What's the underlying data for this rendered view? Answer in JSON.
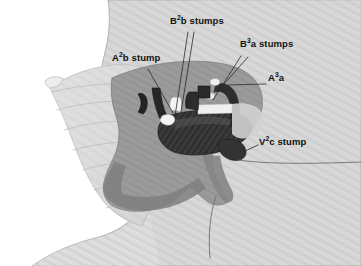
{
  "figure": {
    "background_color": "#d9d9d9",
    "white_margin_color": "#ffffff"
  },
  "annotations": [
    {
      "id": "a2b-stump",
      "text": "A2b stump",
      "base": "A",
      "superscript": "2",
      "suffix": "b stump",
      "x": 112,
      "y": 58,
      "leader": {
        "x1": 148,
        "y1": 69,
        "x2": 173,
        "y2": 113
      }
    },
    {
      "id": "b2b-stumps",
      "text": "B2b stumps",
      "base": "B",
      "superscript": "2",
      "suffix": "b stumps",
      "x": 172,
      "y": 21,
      "leader": {
        "x1": 188,
        "y1": 32,
        "x2": 175,
        "y2": 116
      },
      "leader2": {
        "x1": 194,
        "y1": 32,
        "x2": 180,
        "y2": 112
      }
    },
    {
      "id": "b3a-stumps",
      "text": "B3a stumps",
      "base": "B",
      "superscript": "3",
      "suffix": "a stumps",
      "x": 243,
      "y": 44,
      "leader": {
        "x1": 241,
        "y1": 55,
        "x2": 213,
        "y2": 100
      },
      "leader2": {
        "x1": 248,
        "y1": 56,
        "x2": 216,
        "y2": 93
      }
    },
    {
      "id": "a3a",
      "text": "A3a",
      "base": "A",
      "superscript": "3",
      "suffix": "a",
      "x": 268,
      "y": 77,
      "leader": {
        "x1": 266,
        "y1": 84,
        "x2": 228,
        "y2": 85
      }
    },
    {
      "id": "v2c-stump",
      "text": "V2c stump",
      "base": "V",
      "superscript": "2",
      "suffix": "c stump",
      "x": 259,
      "y": 141,
      "leader": {
        "x1": 257,
        "y1": 145,
        "x2": 242,
        "y2": 152
      }
    }
  ],
  "colors": {
    "background_tissue": "#d6d6d6",
    "chest_wall": "#c9c9c9",
    "lung_lobe": "#dcdcdc",
    "hilum_mid": "#9a9a9a",
    "hilum_dark": "#8a8a8a",
    "cut_surface": "#3a3a3a",
    "retractor_gray": "#8f8f8f",
    "highlight_white": "#f2f2f2",
    "stump_dark": "#2b2b2b",
    "leader_line": "#2a2a2a",
    "label_text": "#111111"
  },
  "regions": [
    {
      "name": "background-striated-field",
      "label": "striated gray operative field background"
    },
    {
      "name": "patient-body-contour",
      "label": "patient body outline lower left"
    },
    {
      "name": "retracted-lung-lobe",
      "label": "pale fan-shaped retracted lung lobe"
    },
    {
      "name": "hilar-surgical-field",
      "label": "central darker gray hilar dissection field"
    },
    {
      "name": "dark-cut-surface",
      "label": "dark hatched parenchymal cut surface"
    },
    {
      "name": "drain-tube",
      "label": "thin curved drain or suture line"
    }
  ]
}
